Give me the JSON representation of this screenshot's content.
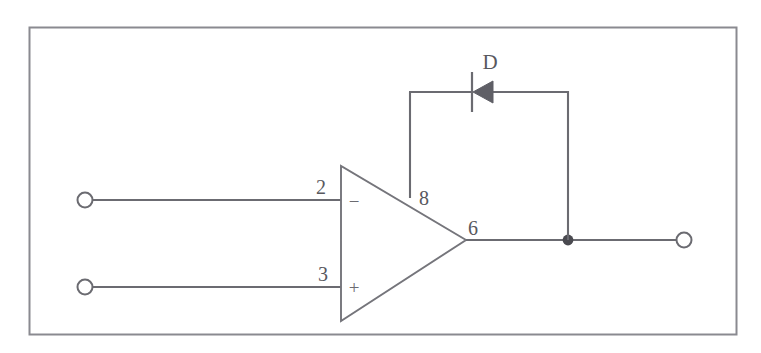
{
  "figure": {
    "name": "op-amp-diode-feedback-circuit",
    "frame": {
      "stroke_color": "#8a8a90",
      "background_color": "#ffffff"
    },
    "wire_color": "#6b6b71",
    "label_color": "#58585e"
  },
  "opamp": {
    "name": "operational-amplifier",
    "inverting_input": {
      "pin_number": "2",
      "polarity_symbol": "−"
    },
    "noninverting_input": {
      "pin_number": "3",
      "polarity_symbol": "+"
    },
    "feedback_pin": {
      "pin_number": "8"
    },
    "output_pin": {
      "pin_number": "6"
    }
  },
  "diode": {
    "name": "feedback-diode",
    "reference_designator": "D",
    "orientation": "cathode-left"
  },
  "terminals": {
    "input_inverting": "",
    "input_noninverting": "",
    "output": ""
  }
}
